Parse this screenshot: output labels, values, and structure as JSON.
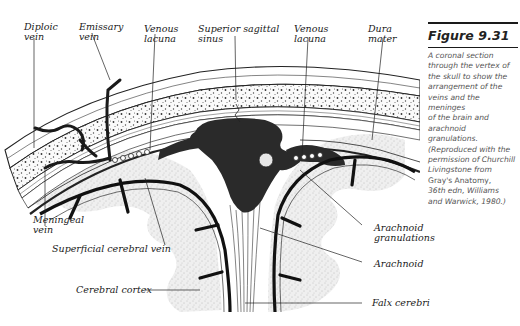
{
  "figure": {
    "number": "Figure 9.31",
    "caption_lines": [
      "A coronal section",
      "through the vertex of",
      "the skull to show the",
      "arrangement of the",
      "veins and the meninges",
      "of the brain and",
      "arachnoid granulations.",
      "(Reproduced with the",
      "permission of Churchill",
      "Livingstone from",
      "Gray's Anatomy,",
      "36th edn, Williams",
      "and Warwick, 1980.)"
    ]
  },
  "diagram": {
    "description": "Coronal section through the vertex of the skull",
    "labels": {
      "diploic_vein": "Diploic\nvein",
      "emissary_vein": "Emissary\nvein",
      "venous_lacuna_left": "Venous\nlacuna",
      "superior_sagittal_sinus": "Superior sagittal\nsinus",
      "venous_lacuna_right": "Venous\nlacuna",
      "dura_mater": "Dura\nmater",
      "meningeal_vein": "Meningeal\nvein",
      "superficial_cerebral_vein": "Superficial cerebral vein",
      "arachnoid_granulations": "Arachnoid\ngranulations",
      "arachnoid": "Arachnoid",
      "cerebral_cortex": "Cerebral cortex",
      "falx_cerebri": "Falx cerebri"
    }
  }
}
